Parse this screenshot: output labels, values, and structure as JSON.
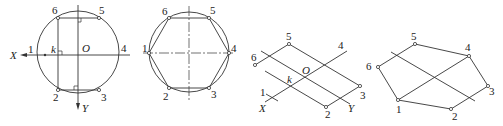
{
  "figure": {
    "panels": [
      {
        "id": "a",
        "description": "Circumscribed circle with hexagon vertices, X/Y axes through center O",
        "labels": {
          "p1": "1",
          "p2": "2",
          "p3": "3",
          "p4": "4",
          "p5": "5",
          "p6": "6",
          "origin": "O",
          "k": "k",
          "x_axis": "X",
          "y_axis": "Y"
        }
      },
      {
        "id": "b",
        "description": "Regular hexagon inscribed in circle",
        "labels": {
          "p1": "1",
          "p2": "2",
          "p3": "3",
          "p4": "4",
          "p5": "5",
          "p6": "6"
        }
      },
      {
        "id": "c",
        "description": "Isometric axes with points located along parallels",
        "labels": {
          "p1": "1",
          "p2": "2",
          "p3": "3",
          "p4": "4",
          "p5": "5",
          "p6": "6",
          "origin": "O",
          "k": "k",
          "x_axis": "X",
          "y_axis": "Y"
        }
      },
      {
        "id": "d",
        "description": "Completed isometric hexagon",
        "labels": {
          "p1": "1",
          "p2": "2",
          "p3": "3",
          "p4": "4",
          "p5": "5",
          "p6": "6"
        }
      }
    ]
  }
}
